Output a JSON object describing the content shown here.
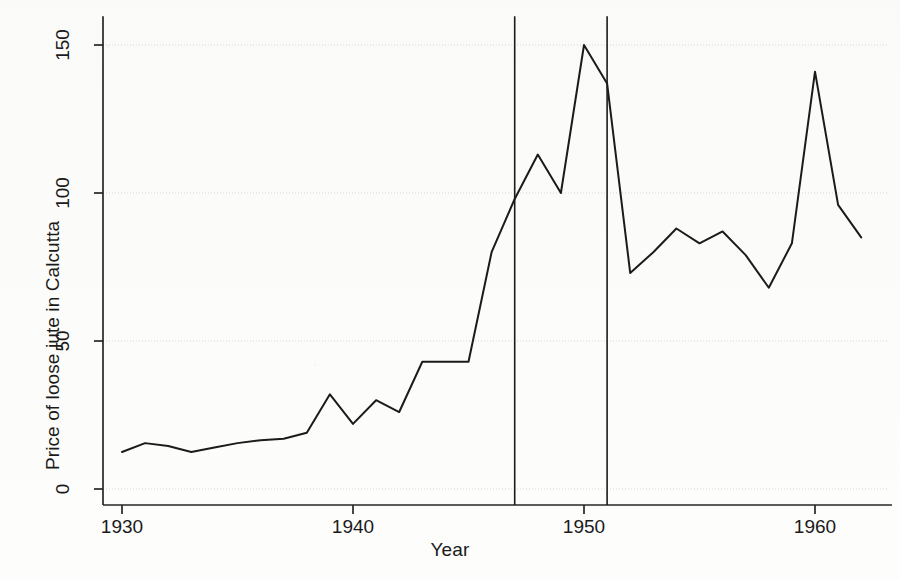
{
  "chart_data": {
    "type": "line",
    "title": "",
    "xlabel": "Year",
    "ylabel": "Price of loose jute in Calcutta",
    "xlim": [
      1929.3,
      1962.4
    ],
    "ylim": [
      0,
      155
    ],
    "xticks": [
      1930,
      1940,
      1950,
      1960
    ],
    "xtick_labels": [
      "1930",
      "1940",
      "1950",
      "1960"
    ],
    "yticks": [
      0,
      50,
      100,
      150
    ],
    "ytick_labels": [
      "0",
      "50",
      "100",
      "150"
    ],
    "grid": "horizontal-faint",
    "legend": "none",
    "line_color": "#1b1b1b",
    "line_width": 2.0,
    "background_color": "#fdfdfc",
    "x": [
      1930,
      1931,
      1932,
      1933,
      1934,
      1935,
      1936,
      1937,
      1938,
      1939,
      1940,
      1941,
      1942,
      1943,
      1944,
      1945,
      1946,
      1947,
      1948,
      1949,
      1950,
      1951,
      1952,
      1953,
      1954,
      1955,
      1956,
      1957,
      1958,
      1959,
      1960,
      1961,
      1962
    ],
    "values": [
      12.5,
      15.5,
      14.5,
      12.5,
      14,
      15.5,
      16.5,
      17,
      19,
      32,
      22,
      30,
      26,
      43,
      43,
      43,
      80,
      98,
      113,
      100,
      150,
      137,
      73,
      80,
      88,
      83,
      87,
      79,
      68,
      83,
      141,
      96,
      85
    ],
    "series": [
      {
        "name": "Price of loose jute in Calcutta",
        "x": [
          1930,
          1931,
          1932,
          1933,
          1934,
          1935,
          1936,
          1937,
          1938,
          1939,
          1940,
          1941,
          1942,
          1943,
          1944,
          1945,
          1946,
          1947,
          1948,
          1949,
          1950,
          1951,
          1952,
          1953,
          1954,
          1955,
          1956,
          1957,
          1958,
          1959,
          1960,
          1961,
          1962
        ],
        "values": [
          12.5,
          15.5,
          14.5,
          12.5,
          14,
          15.5,
          16.5,
          17,
          19,
          32,
          22,
          30,
          26,
          43,
          43,
          43,
          80,
          98,
          113,
          100,
          150,
          137,
          73,
          80,
          88,
          83,
          87,
          79,
          68,
          83,
          141,
          96,
          85
        ]
      }
    ],
    "annotations": [
      {
        "type": "vline",
        "x": 1947,
        "label": "",
        "color": "#1b1b1b",
        "width": 1.6
      },
      {
        "type": "vline",
        "x": 1951,
        "label": "",
        "color": "#1b1b1b",
        "width": 1.6
      }
    ]
  }
}
